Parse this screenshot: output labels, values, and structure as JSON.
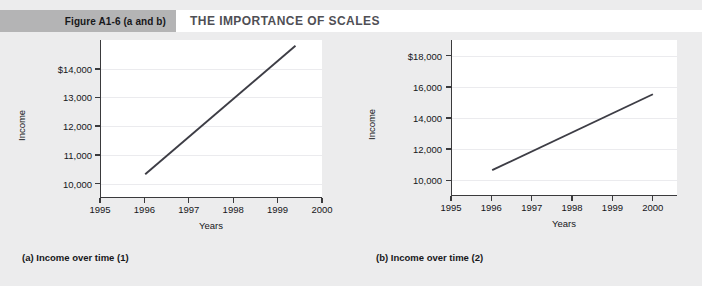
{
  "header": {
    "figure_tab": "Figure A1-6 (a and b)",
    "title": "THE IMPORTANCE OF SCALES",
    "tab_color": "#b4b4b5",
    "title_color": "#4f4f55"
  },
  "page": {
    "background": "#ececed",
    "plot_background": "#ffffff",
    "axis_color": "#3a3a3c",
    "grid_color": "#ebebee",
    "line_color": "#3d3d45"
  },
  "captions": {
    "a": "(a)  Income over time (1)",
    "b": "(b)  Income over time (2)"
  },
  "chart_data": [
    {
      "id": "a",
      "type": "line",
      "title": "Income over time (1)",
      "xlabel": "Years",
      "ylabel": "Income",
      "xlim": [
        1995,
        2000
      ],
      "ylim": [
        9500,
        15000
      ],
      "xticks": [
        1995,
        1996,
        1997,
        1998,
        1999,
        2000
      ],
      "xticklabels": [
        "1995",
        "1996",
        "1997",
        "1998",
        "1999",
        "2000"
      ],
      "yticks": [
        10000,
        11000,
        12000,
        13000,
        14000
      ],
      "yticklabels": [
        "10,000",
        "11,000",
        "12,000",
        "13,000",
        "$14,000"
      ],
      "grid": true,
      "legend": "none",
      "series": [
        {
          "name": "Income",
          "x": [
            1996,
            1999.4
          ],
          "values": [
            10300,
            14800
          ]
        }
      ]
    },
    {
      "id": "b",
      "type": "line",
      "title": "Income over time (2)",
      "xlabel": "Years",
      "ylabel": "Income",
      "xlim": [
        1995,
        2000.6
      ],
      "ylim": [
        9000,
        19000
      ],
      "xticks": [
        1995,
        1996,
        1997,
        1998,
        1999,
        2000
      ],
      "xticklabels": [
        "1995",
        "1996",
        "1997",
        "1998",
        "1999",
        "2000"
      ],
      "yticks": [
        10000,
        12000,
        14000,
        16000,
        18000
      ],
      "yticklabels": [
        "10,000",
        "12,000",
        "14,000",
        "16,000",
        "$18,000"
      ],
      "grid": true,
      "legend": "none",
      "series": [
        {
          "name": "Income",
          "x": [
            1996,
            2000
          ],
          "values": [
            10600,
            15500
          ]
        }
      ]
    }
  ]
}
